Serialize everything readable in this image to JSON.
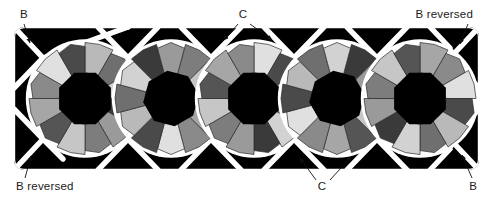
{
  "figure": {
    "background_color": "#ffffff",
    "band": {
      "x": 14,
      "y": 27,
      "width": 465,
      "height": 143,
      "fill_color": "#000000",
      "grout_color": "#ffffff",
      "grout_width": 5.2
    },
    "rosettes": {
      "count": 5,
      "centers_x": [
        85,
        171,
        254,
        337,
        420
      ],
      "center_y": 98.5,
      "outer_radius": 56,
      "core_radius": 26,
      "core_color": "#000000",
      "ring_shades": [
        "#b9b9b9",
        "#6f6f6f",
        "#d2d2d2",
        "#3a3a3a",
        "#9a9a9a",
        "#7d7d7d",
        "#c6c6c6",
        "#555555",
        "#a6a6a6",
        "#8a8a8a",
        "#e0e0e0",
        "#4a4a4a"
      ],
      "outline_color": "#2a2a2a"
    },
    "interstices": {
      "description": "black triangular wedges between rosettes along top and bottom edges and at the left and right ends",
      "color": "#000000",
      "top_count": 6,
      "bottom_count": 6,
      "end_count": 4
    }
  },
  "labels": [
    {
      "id": "label-b-top-left",
      "text": "B",
      "x": 20,
      "y": 18,
      "anchor": "start"
    },
    {
      "id": "label-c-top",
      "text": "C",
      "x": 243,
      "y": 18,
      "anchor": "middle"
    },
    {
      "id": "label-b-reversed-top-right",
      "text": "B reversed",
      "x": 473,
      "y": 18,
      "anchor": "end"
    },
    {
      "id": "label-b-reversed-bottom-left",
      "text": "B reversed",
      "x": 16,
      "y": 190,
      "anchor": "start"
    },
    {
      "id": "label-c-bottom",
      "text": "C",
      "x": 322,
      "y": 190,
      "anchor": "middle"
    },
    {
      "id": "label-b-bottom-right",
      "text": "B",
      "x": 477,
      "y": 190,
      "anchor": "end"
    }
  ],
  "leader_lines": [
    {
      "id": "leader-b-top-left",
      "from": [
        24,
        24
      ],
      "to": [
        30,
        43
      ],
      "arrow": true
    },
    {
      "id": "leader-c-top-left-arrow",
      "from": [
        238,
        24
      ],
      "to": [
        224,
        40
      ],
      "arrow": true
    },
    {
      "id": "leader-c-top-right-arrow",
      "from": [
        250,
        24
      ],
      "to": [
        272,
        40
      ],
      "arrow": true
    },
    {
      "id": "leader-b-reversed-top-right",
      "from": [
        468,
        24
      ],
      "to": [
        460,
        44
      ],
      "arrow": true
    },
    {
      "id": "leader-b-reversed-bottom-left",
      "from": [
        25,
        178
      ],
      "to": [
        31,
        156
      ],
      "arrow": true
    },
    {
      "id": "leader-c-bottom-left-arrow",
      "from": [
        316,
        180
      ],
      "to": [
        300,
        158
      ],
      "arrow": true
    },
    {
      "id": "leader-c-bottom-right-arrow",
      "from": [
        330,
        180
      ],
      "to": [
        351,
        157
      ],
      "arrow": true
    },
    {
      "id": "leader-b-bottom-right",
      "from": [
        472,
        178
      ],
      "to": [
        462,
        155
      ],
      "arrow": true
    }
  ],
  "colors": {
    "ink": "#1a1a1a",
    "tile_black": "#000000",
    "grout_white": "#ffffff"
  }
}
